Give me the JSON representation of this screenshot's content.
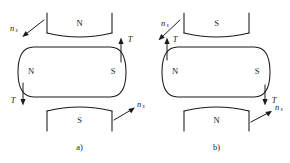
{
  "figure": {
    "stroke_color": "#1a1a1a",
    "background_color": "#ffffff"
  },
  "panels": [
    {
      "id": "a",
      "caption": "a)",
      "stator_top": {
        "pole": "N"
      },
      "stator_bottom": {
        "pole": "S"
      },
      "rotor": {
        "pole_left": "N",
        "pole_right": "S"
      },
      "torque_arrows": [
        {
          "label": "T",
          "direction": "up",
          "position": "right"
        },
        {
          "label": "T",
          "direction": "down",
          "position": "left"
        }
      ],
      "speed_arrows": [
        {
          "label": "n",
          "subscript": "s",
          "direction": "down-right",
          "position": "top-left"
        },
        {
          "label": "n",
          "subscript": "s",
          "direction": "up-right",
          "position": "bottom-right"
        }
      ]
    },
    {
      "id": "b",
      "caption": "b)",
      "stator_top": {
        "pole": "S"
      },
      "stator_bottom": {
        "pole": "N"
      },
      "rotor": {
        "pole_left": "N",
        "pole_right": "S"
      },
      "torque_arrows": [
        {
          "label": "T",
          "direction": "up",
          "position": "left"
        },
        {
          "label": "T",
          "direction": "down",
          "position": "right"
        }
      ],
      "speed_arrows": [
        {
          "label": "n",
          "subscript": "s",
          "direction": "down-left",
          "position": "top-left"
        },
        {
          "label": "n",
          "subscript": "s",
          "direction": "up-right",
          "position": "bottom-right"
        }
      ]
    }
  ]
}
